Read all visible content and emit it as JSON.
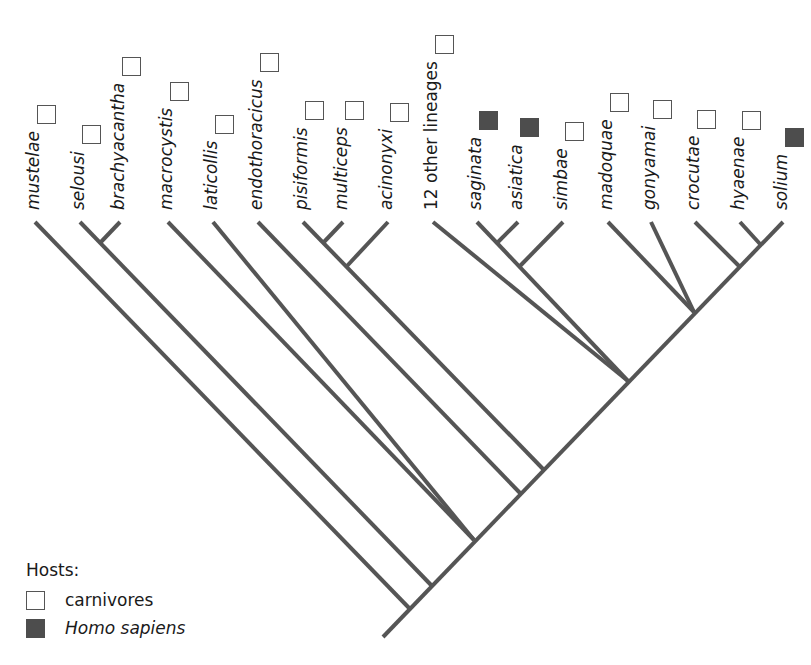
{
  "figure": {
    "type": "phylogenetic-tree",
    "branch_color": "#555555",
    "host_colors": {
      "carnivores": "#ffffff",
      "homo_sapiens": "#4d4d4d"
    }
  },
  "legend": {
    "title": "Hosts:",
    "items": [
      {
        "label": "carnivores",
        "host": "carnivores",
        "italic": false
      },
      {
        "label": "Homo sapiens",
        "host": "homo_sapiens",
        "italic": true
      }
    ]
  },
  "leaves": [
    {
      "label": "mustelae",
      "host": "carnivores",
      "italic": true,
      "x": 35,
      "tip_y": 222
    },
    {
      "label": "selousi",
      "host": "carnivores",
      "italic": true,
      "x": 80,
      "tip_y": 222
    },
    {
      "label": "brachyacantha",
      "host": "carnivores",
      "italic": true,
      "x": 120,
      "tip_y": 222
    },
    {
      "label": "macrocystis",
      "host": "carnivores",
      "italic": true,
      "x": 168,
      "tip_y": 222
    },
    {
      "label": "laticollis",
      "host": "carnivores",
      "italic": true,
      "x": 213,
      "tip_y": 222
    },
    {
      "label": "endothoracicus",
      "host": "carnivores",
      "italic": true,
      "x": 258,
      "tip_y": 222
    },
    {
      "label": "pisiformis",
      "host": "carnivores",
      "italic": true,
      "x": 303,
      "tip_y": 222
    },
    {
      "label": "multiceps",
      "host": "carnivores",
      "italic": true,
      "x": 343,
      "tip_y": 222
    },
    {
      "label": "acinonyxi",
      "host": "carnivores",
      "italic": true,
      "x": 388,
      "tip_y": 222
    },
    {
      "label": "12 other lineages",
      "host": "carnivores",
      "italic": false,
      "x": 433,
      "tip_y": 222
    },
    {
      "label": "saginata",
      "host": "homo_sapiens",
      "italic": true,
      "x": 477,
      "tip_y": 222
    },
    {
      "label": "asiatica",
      "host": "homo_sapiens",
      "italic": true,
      "x": 518,
      "tip_y": 222
    },
    {
      "label": "simbae",
      "host": "carnivores",
      "italic": true,
      "x": 563,
      "tip_y": 222
    },
    {
      "label": "madoquae",
      "host": "carnivores",
      "italic": true,
      "x": 608,
      "tip_y": 222
    },
    {
      "label": "gonyamai",
      "host": "carnivores",
      "italic": true,
      "x": 651,
      "tip_y": 222
    },
    {
      "label": "crocutae",
      "host": "carnivores",
      "italic": true,
      "x": 695,
      "tip_y": 222
    },
    {
      "label": "hyaenae",
      "host": "carnivores",
      "italic": true,
      "x": 740,
      "tip_y": 222
    },
    {
      "label": "solium",
      "host": "homo_sapiens",
      "italic": true,
      "x": 783,
      "tip_y": 222
    }
  ],
  "branches": [
    [
      383,
      637,
      783,
      222
    ],
    [
      410,
      609,
      35,
      222
    ],
    [
      432,
      586,
      80,
      222
    ],
    [
      100,
      243,
      120,
      222
    ],
    [
      474,
      540,
      168,
      222
    ],
    [
      474,
      540,
      213,
      222
    ],
    [
      520,
      493,
      258,
      222
    ],
    [
      543,
      469,
      303,
      222
    ],
    [
      323,
      243,
      343,
      222
    ],
    [
      347,
      266,
      388,
      222
    ],
    [
      628,
      381,
      433,
      222
    ],
    [
      628,
      381,
      477,
      222
    ],
    [
      497,
      243,
      518,
      222
    ],
    [
      520,
      266,
      563,
      222
    ],
    [
      694,
      312,
      608,
      222
    ],
    [
      694,
      312,
      651,
      222
    ],
    [
      739,
      266,
      695,
      222
    ],
    [
      760,
      244,
      740,
      222
    ]
  ]
}
